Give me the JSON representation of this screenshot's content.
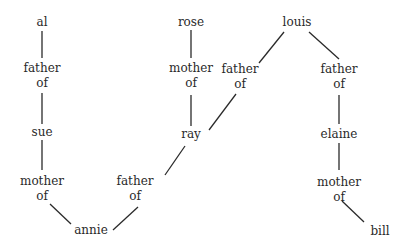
{
  "diagram": {
    "type": "family-relationship-graph",
    "nodes": {
      "al": {
        "label": "al"
      },
      "father_of_1": {
        "line1": "father",
        "line2": "of"
      },
      "sue": {
        "label": "sue"
      },
      "mother_of_1": {
        "line1": "mother",
        "line2": "of"
      },
      "annie": {
        "label": "annie"
      },
      "rose": {
        "label": "rose"
      },
      "mother_of_2": {
        "line1": "mother",
        "line2": "of"
      },
      "ray": {
        "label": "ray"
      },
      "father_of_2": {
        "line1": "father",
        "line2": "of"
      },
      "louis": {
        "label": "louis"
      },
      "father_of_3": {
        "line1": "father",
        "line2": "of"
      },
      "father_of_4": {
        "line1": "father",
        "line2": "of"
      },
      "elaine": {
        "label": "elaine"
      },
      "mother_of_3": {
        "line1": "mother",
        "line2": "of"
      },
      "bill": {
        "label": "bill"
      }
    },
    "edges": [
      [
        "al",
        "father_of_1"
      ],
      [
        "father_of_1",
        "sue"
      ],
      [
        "sue",
        "mother_of_1"
      ],
      [
        "mother_of_1",
        "annie"
      ],
      [
        "rose",
        "mother_of_2"
      ],
      [
        "mother_of_2",
        "ray"
      ],
      [
        "ray",
        "father_of_2"
      ],
      [
        "father_of_2",
        "annie"
      ],
      [
        "louis",
        "father_of_3"
      ],
      [
        "father_of_3",
        "ray"
      ],
      [
        "louis",
        "father_of_4"
      ],
      [
        "father_of_4",
        "elaine"
      ],
      [
        "elaine",
        "mother_of_3"
      ],
      [
        "mother_of_3",
        "bill"
      ]
    ],
    "line_color": "#2a2a2a",
    "text_color": "#2a2a2a",
    "background": "#ffffff"
  }
}
